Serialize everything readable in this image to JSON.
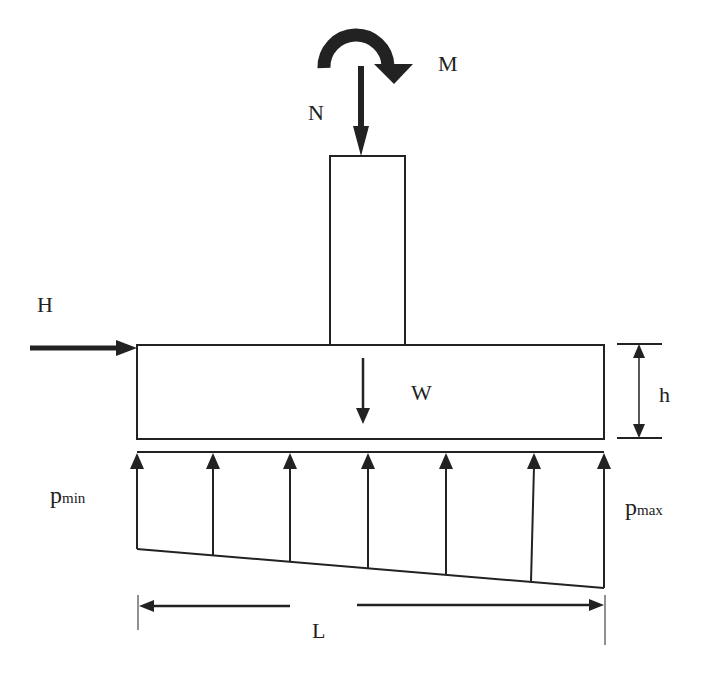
{
  "diagram": {
    "type": "footing-free-body-diagram",
    "colors": {
      "stroke": "#222222",
      "background": "#ffffff"
    },
    "labels": {
      "moment": "M",
      "axial_load": "N",
      "horizontal_load": "H",
      "self_weight": "W",
      "height": "h",
      "length": "L",
      "p_min_base": "p",
      "p_min_sub": "min",
      "p_max_base": "p",
      "p_max_sub": "max"
    },
    "elements": {
      "column": {
        "x": 330,
        "y": 156,
        "width": 75,
        "height": 189
      },
      "footing": {
        "x": 137,
        "y": 345,
        "width": 467,
        "height": 94
      },
      "ground_line_y": 452,
      "pressure_bottom": {
        "left_y": 549,
        "right_y": 588
      },
      "pressure_arrows_x": [
        137,
        213,
        290,
        368,
        446,
        534,
        604
      ]
    }
  }
}
